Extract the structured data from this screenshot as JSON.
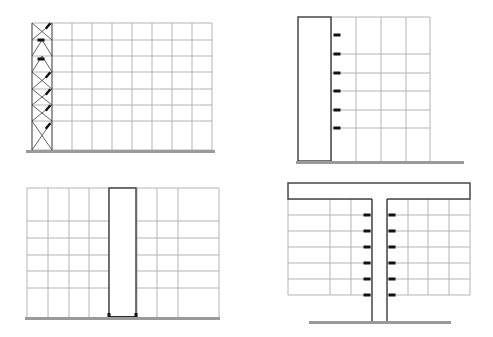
{
  "colors": {
    "background": "#ffffff",
    "grid": "#b4b4b4",
    "structure": "#3a3a3a",
    "connector": "#111111",
    "ground": "#9a9a9a"
  },
  "panels": [
    {
      "id": "braced-frame",
      "description": "Multi-story frame with cross-braced bay at left, connectors along braced bay",
      "frame": {
        "x": 32,
        "y": 23,
        "w": 180,
        "h": 127
      },
      "columns_x": [
        32,
        52,
        72,
        92,
        112,
        132,
        152,
        172,
        192,
        212
      ],
      "floors_y": [
        23,
        40,
        56,
        72,
        89,
        105,
        121,
        150
      ],
      "braced_bay": {
        "x0": 32,
        "x1": 52
      },
      "connectors": [
        {
          "x": 48,
          "y": 26,
          "type": "diagonal"
        },
        {
          "x": 41,
          "y": 40,
          "type": "horizontal"
        },
        {
          "x": 41,
          "y": 59,
          "type": "horizontal"
        },
        {
          "x": 48,
          "y": 75,
          "type": "diagonal"
        },
        {
          "x": 48,
          "y": 92,
          "type": "diagonal"
        },
        {
          "x": 48,
          "y": 108,
          "type": "diagonal"
        },
        {
          "x": 48,
          "y": 126,
          "type": "diagonal"
        }
      ],
      "ground": {
        "x0": 26,
        "x1": 215,
        "y": 151
      }
    },
    {
      "id": "side-core",
      "description": "Frame attached to a tall shear core on its left side",
      "core": {
        "x": 298,
        "y": 17,
        "w": 33,
        "h": 144
      },
      "columns_x": [
        331,
        356,
        381,
        406,
        430
      ],
      "floors_y": [
        17,
        54,
        73,
        91,
        110,
        128,
        161
      ],
      "connectors_x": 337,
      "connectors_y": [
        35,
        54,
        73,
        91,
        110,
        128
      ],
      "ground": {
        "x0": 296,
        "x1": 464,
        "y": 162
      }
    },
    {
      "id": "central-core",
      "description": "Frame split by a central core with base connectors",
      "frame": {
        "x": 27,
        "y": 188,
        "w": 192,
        "h": 129
      },
      "columns_x": [
        27,
        48,
        69,
        89,
        109,
        137,
        157,
        178,
        219
      ],
      "floors_y": [
        188,
        221,
        238,
        255,
        271,
        288,
        317
      ],
      "core": {
        "x": 109,
        "y": 188,
        "w": 27,
        "h": 129
      },
      "ground": {
        "x0": 25,
        "x1": 220,
        "y": 318
      }
    },
    {
      "id": "t-core",
      "description": "Central stem core supporting a top transfer beam with hung floors on both sides",
      "top_beam": {
        "x": 288,
        "y": 183,
        "w": 182,
        "h": 16
      },
      "stem": {
        "x0": 372,
        "x1": 387,
        "y0": 199,
        "y1": 322
      },
      "left_columns_x": [
        288,
        330,
        351,
        372
      ],
      "right_columns_x": [
        387,
        408,
        428,
        449,
        470
      ],
      "floors_y": [
        199,
        215,
        231,
        247,
        263,
        279,
        295
      ],
      "connectors_y": [
        215,
        231,
        247,
        263,
        279,
        295
      ],
      "ground": {
        "x0": 309,
        "x1": 451,
        "y": 322
      }
    }
  ]
}
